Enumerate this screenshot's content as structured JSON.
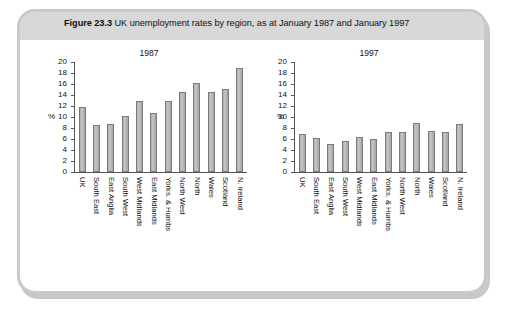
{
  "figure": {
    "number": "Figure 23.3",
    "caption": "UK unemployment rates by region, as at January 1987 and January 1997"
  },
  "chart_data": [
    {
      "type": "bar",
      "title": "1987",
      "xlabel": "",
      "ylabel": "%",
      "ylim": [
        0,
        20
      ],
      "yticks": [
        0,
        2,
        4,
        6,
        8,
        10,
        12,
        14,
        16,
        18,
        20
      ],
      "grid": false,
      "legend": null,
      "categories": [
        "UK",
        "South East",
        "East Anglia",
        "South West",
        "West Midlands",
        "East Midlands",
        "Yorks. & Humbs",
        "North West",
        "North",
        "Wales",
        "Scotland",
        "N. Ireland"
      ],
      "values": [
        11.8,
        8.5,
        8.8,
        10.2,
        13.0,
        10.7,
        13.0,
        14.5,
        16.1,
        14.5,
        15.1,
        18.9
      ]
    },
    {
      "type": "bar",
      "title": "1997",
      "xlabel": "",
      "ylabel": "%",
      "ylim": [
        0,
        20
      ],
      "yticks": [
        0,
        2,
        4,
        6,
        8,
        10,
        12,
        14,
        16,
        18,
        20
      ],
      "grid": false,
      "legend": null,
      "categories": [
        "UK",
        "South East",
        "East Anglia",
        "South West",
        "West Midlands",
        "East Midlands",
        "Yorks. & Humbs",
        "North West",
        "North",
        "Wales",
        "Scotland",
        "N. Ireland"
      ],
      "values": [
        7.0,
        6.2,
        5.1,
        5.7,
        6.4,
        6.0,
        7.3,
        7.3,
        8.9,
        7.5,
        7.3,
        8.8
      ]
    }
  ],
  "colors": {
    "bar_fill": "#b9b9b9",
    "bar_border": "#7b7b7b",
    "frame_border": "#c9c9c9",
    "header_band": "#d8d8d8",
    "text": "#111111"
  }
}
